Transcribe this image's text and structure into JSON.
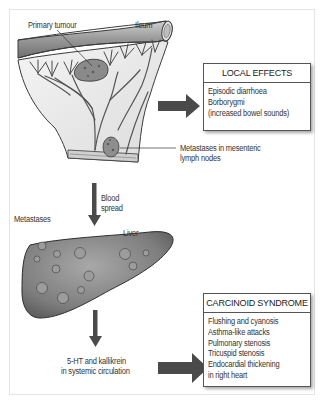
{
  "figure": {
    "labels": {
      "primary_tumour": "Primary tumour",
      "ileum": "Ileum",
      "mesenteric_metastases_line1": "Metastases in mesenteric",
      "mesenteric_metastases_line2": "lymph nodes",
      "blood_spread_line1": "Blood",
      "blood_spread_line2": "spread",
      "metastases": "Metastases",
      "liver": "Liver",
      "circulation_line1": "5-HT and kallikrein",
      "circulation_line2": "in systemic circulation"
    },
    "local_effects": {
      "title": "LOCAL EFFECTS",
      "items": [
        "Episodic diarrhoea",
        "Borborygmi",
        "(increased bowel sounds)"
      ]
    },
    "carcinoid_syndrome": {
      "title": "CARCINOID SYNDROME",
      "items": [
        "Flushing and cyanosis",
        "Asthma-like attacks",
        "Pulmonary stenosis",
        "Tricuspid stenosis",
        "Endocardial thickening",
        "in right heart"
      ]
    },
    "colors": {
      "arrow": "#4a4a4a",
      "liver_fill": "#8a8a8a",
      "ileum_fill": "#9a9a9a",
      "mesentery_fill": "#efefef",
      "outline": "#3a3a3a"
    }
  }
}
